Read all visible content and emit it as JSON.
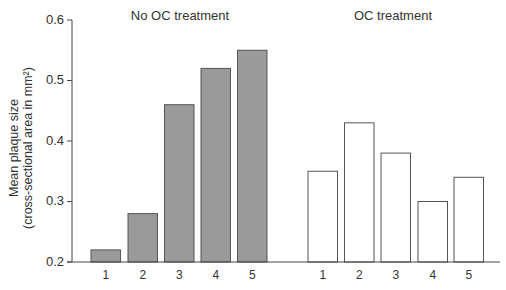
{
  "chart_data": {
    "type": "bar",
    "title": "",
    "ylabel": "Mean plaque size (cross-sectional area in mm²)",
    "ylabel_lines": [
      "Mean plaque size",
      "(cross-sectional area in mm²)"
    ],
    "xlabel": "",
    "ylim": [
      0.2,
      0.6
    ],
    "yticks": [
      "0.6",
      "0.5",
      "0.4",
      "0.3",
      "0.2"
    ],
    "grid": false,
    "panels": [
      {
        "title": "No OC treatment",
        "categories": [
          "1",
          "2",
          "3",
          "4",
          "5"
        ],
        "values": [
          0.22,
          0.28,
          0.46,
          0.52,
          0.55
        ],
        "fill": "#9a9a9a"
      },
      {
        "title": "OC treatment",
        "categories": [
          "1",
          "2",
          "3",
          "4",
          "5"
        ],
        "values": [
          0.35,
          0.43,
          0.38,
          0.3,
          0.34
        ],
        "fill": "#ffffff"
      }
    ]
  },
  "colors": {
    "gray_bar": "#9a9a9a",
    "bar_border": "#555555",
    "axis": "#444444"
  }
}
